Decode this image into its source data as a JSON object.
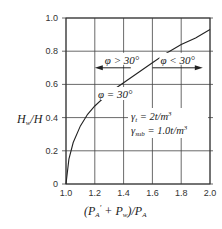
{
  "chart_data": {
    "type": "line",
    "title": "",
    "xlabel": "(P_A' + P_w) / P_A",
    "ylabel": "H_w / H",
    "xlim": [
      1.0,
      2.0
    ],
    "ylim": [
      0,
      1.0
    ],
    "grid": true,
    "x_ticks": [
      "1.0",
      "1.2",
      "1.4",
      "1.6",
      "1.8",
      "2.0"
    ],
    "y_ticks": [
      "0",
      "0.2",
      "0.4",
      "0.6",
      "0.8",
      "1.0"
    ],
    "series": [
      {
        "name": "φ = 30°",
        "x": [
          1.0,
          1.02,
          1.05,
          1.1,
          1.15,
          1.2,
          1.3,
          1.4,
          1.5,
          1.6,
          1.7,
          1.8,
          1.9,
          2.0
        ],
        "y": [
          0,
          0.15,
          0.25,
          0.35,
          0.42,
          0.47,
          0.55,
          0.61,
          0.67,
          0.73,
          0.79,
          0.84,
          0.88,
          0.93
        ]
      }
    ],
    "annotations": [
      {
        "text": "φ > 30°",
        "type": "arrow-left",
        "x_from": 1.45,
        "x_to": 1.2,
        "y": 0.7
      },
      {
        "text": "φ < 30°",
        "type": "arrow-right",
        "x_from": 1.6,
        "x_to": 1.95,
        "y": 0.7
      },
      {
        "text": "φ = 30°",
        "x": 1.33,
        "y": 0.55
      },
      {
        "text": "γt = 2t/m³",
        "x": 1.6,
        "y": 0.4
      },
      {
        "text": "γsub = 1.0t/m³",
        "x": 1.6,
        "y": 0.3
      }
    ]
  },
  "labels": {
    "y_axis_H": "H",
    "y_axis_w": "w",
    "y_axis_slash": "/",
    "y_axis_H2": "H",
    "x_axis_text": "(P",
    "phi_gt": "φ > 30°",
    "phi_lt": "φ < 30°",
    "phi_eq": "φ = 30°",
    "gamma_t": "γ",
    "gamma_t_sub": "t",
    "gamma_t_val": " = 2t/m",
    "gamma_sub": "γ",
    "gamma_sub_sub": "sub",
    "gamma_sub_val": " = 1.0t/m",
    "cube": "3"
  }
}
